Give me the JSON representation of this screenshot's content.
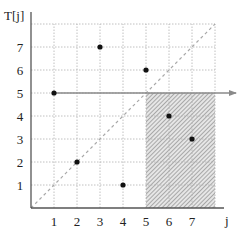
{
  "chart_data": {
    "type": "scatter",
    "title": "",
    "ylabel": "T[j]",
    "xlabel": "j",
    "x_ticks": [
      "1",
      "2",
      "3",
      "4",
      "5",
      "6",
      "7"
    ],
    "y_ticks": [
      "1",
      "2",
      "3",
      "4",
      "5",
      "6",
      "7"
    ],
    "xlim": [
      0,
      7.8
    ],
    "ylim": [
      0,
      7.8
    ],
    "grid": true,
    "grid_style": "dotted",
    "points": [
      {
        "x": 1,
        "y": 5
      },
      {
        "x": 2,
        "y": 2
      },
      {
        "x": 3,
        "y": 7
      },
      {
        "x": 4,
        "y": 1
      },
      {
        "x": 5,
        "y": 6
      },
      {
        "x": 6,
        "y": 4
      },
      {
        "x": 7,
        "y": 3
      }
    ],
    "reference_lines": [
      {
        "type": "diagonal",
        "from": [
          0,
          0
        ],
        "to": [
          8,
          8
        ],
        "style": "dashed",
        "color": "#a0a0a0"
      },
      {
        "type": "horizontal",
        "y": 5,
        "x_from": 1,
        "x_to": 8.8,
        "arrow": true,
        "color": "#808080"
      }
    ],
    "shaded_regions": [
      {
        "x_from": 5,
        "x_to": 8,
        "y_from": 0,
        "y_to": 5,
        "pattern": "diagonal-hatch",
        "color": "#9a9a9a"
      }
    ]
  },
  "colors": {
    "axis": "#555555",
    "grid": "#b0b0b0",
    "point": "#111111",
    "diagonal": "#a8a8a8",
    "hline": "#8a8a8a",
    "hatch": "#a0a0a0"
  }
}
